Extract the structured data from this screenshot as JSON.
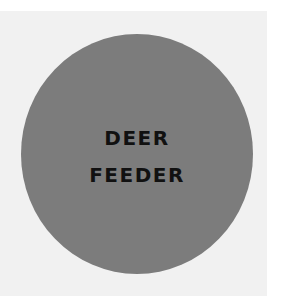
{
  "badge": {
    "lines": [
      "DEER",
      "FEEDER"
    ],
    "circle_color": "#7c7c7c",
    "text_color": "#111111",
    "background_color": "#f1f1f1"
  }
}
